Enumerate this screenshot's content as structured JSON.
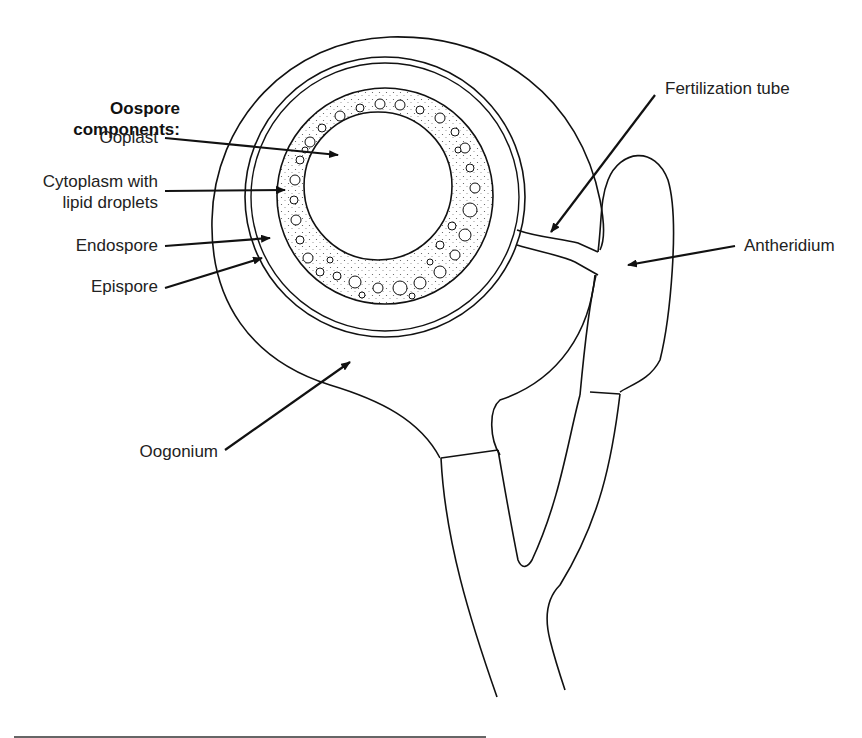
{
  "heading": {
    "line1": "Oospore",
    "line2": "components:"
  },
  "labels": {
    "ooplast": "Ooplast",
    "cytoplasm_line1": "Cytoplasm with",
    "cytoplasm_line2": "lipid droplets",
    "endospore": "Endospore",
    "epispore": "Epispore",
    "oogonium": "Oogonium",
    "fertilization_tube": "Fertilization tube",
    "antheridium": "Antheridium"
  },
  "colors": {
    "line": "#111111",
    "text": "#222222",
    "background": "#ffffff"
  }
}
